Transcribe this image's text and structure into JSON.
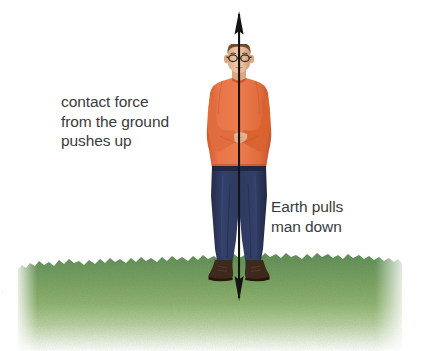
{
  "figure": {
    "background_color": "#ffffff"
  },
  "labels": {
    "contact_force": "contact force\nfrom the ground\npushes up",
    "earth_pull": "Earth pulls\nman down",
    "text_color": "#3b3b3b",
    "edge_artifact": "·"
  },
  "arrow": {
    "name": "double-headed-vertical-force-arrow",
    "color": "#1a1a1a",
    "direction": "both",
    "up_head_tip_y": 14,
    "down_head_tip_y": 295,
    "shaft_x": 239,
    "shaft_width_px": 2
  },
  "man": {
    "skin_color": "#e8c0a2",
    "hair_color": "#6b4a2e",
    "glasses_color": "#2a2320",
    "shirt_color": "#e5703f",
    "shirt_shadow_color": "#c9552b",
    "trousers_color": "#2e3a5c",
    "trousers_shadow_color": "#1f2742",
    "shoes_color": "#3f2a1d",
    "pose": "standing with arms crossed"
  },
  "ground": {
    "name": "grass-strip",
    "top_color": "#3f7a36",
    "mid_color": "#6d9a43",
    "bottom_color": "#ffffff",
    "left_px": 18,
    "top_px": 252,
    "width_px": 384,
    "height_px": 99
  }
}
